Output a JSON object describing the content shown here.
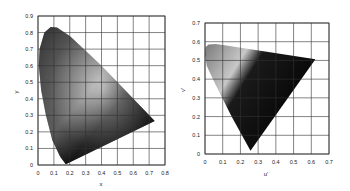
{
  "chart_data": [
    {
      "type": "area",
      "title": "CIE 1931 xy chromaticity diagram",
      "xlabel": "x",
      "ylabel": "y",
      "xlim": [
        0,
        0.8
      ],
      "ylim": [
        0,
        0.9
      ],
      "xticks": [
        "0",
        "0.1",
        "0.2",
        "0.3",
        "0.4",
        "0.5",
        "0.6",
        "0.7",
        "0.8"
      ],
      "yticks": [
        "0",
        "0.1",
        "0.2",
        "0.3",
        "0.4",
        "0.5",
        "0.6",
        "0.7",
        "0.8",
        "0.9"
      ],
      "grid": true,
      "legend": null,
      "gamut_outline": {
        "x": [
          0.175,
          0.14,
          0.09,
          0.05,
          0.02,
          0.005,
          0.01,
          0.04,
          0.08,
          0.12,
          0.2,
          0.3,
          0.4,
          0.5,
          0.6,
          0.735,
          0.175
        ],
        "y": [
          0.005,
          0.05,
          0.15,
          0.3,
          0.45,
          0.6,
          0.7,
          0.8,
          0.834,
          0.83,
          0.78,
          0.69,
          0.6,
          0.5,
          0.4,
          0.265,
          0.005
        ]
      }
    },
    {
      "type": "area",
      "title": "CIE 1976 u'v' chromaticity diagram",
      "xlabel": "u'",
      "ylabel": "v'",
      "xlim": [
        0,
        0.7
      ],
      "ylim": [
        0,
        0.7
      ],
      "xticks": [
        "0",
        "0.1",
        "0.2",
        "0.3",
        "0.4",
        "0.5",
        "0.6",
        "0.7"
      ],
      "yticks": [
        "0",
        "0.1",
        "0.2",
        "0.3",
        "0.4",
        "0.5",
        "0.6",
        "0.7"
      ],
      "grid": true,
      "legend": null,
      "gamut_outline": {
        "x": [
          0.257,
          0.15,
          0.06,
          0.01,
          0.0,
          0.003,
          0.02,
          0.06,
          0.12,
          0.623,
          0.257
        ],
        "y": [
          0.017,
          0.2,
          0.37,
          0.47,
          0.53,
          0.57,
          0.585,
          0.588,
          0.58,
          0.506,
          0.017
        ]
      }
    }
  ]
}
